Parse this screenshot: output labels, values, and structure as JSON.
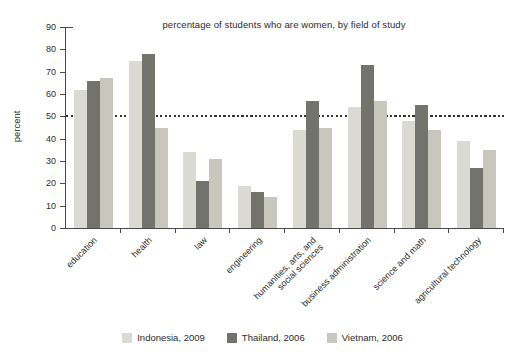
{
  "chart_data": {
    "type": "bar",
    "title": "percentage of students who are women, by field of study",
    "ylabel": "percent",
    "ylim": [
      0,
      90
    ],
    "yticks": [
      0,
      10,
      20,
      30,
      40,
      50,
      60,
      70,
      80,
      90
    ],
    "reference_line": 50,
    "grid": "off",
    "legend_position": "bottom",
    "categories": [
      "education",
      "health",
      "law",
      "engineering",
      "humanities, arts, and\nsocial sciences",
      "business administration",
      "science and math",
      "agricultural technology"
    ],
    "series": [
      {
        "name": "Indonesia, 2009",
        "color": "#dbdad2",
        "values": [
          62,
          75,
          34,
          19,
          44,
          54,
          48,
          39
        ]
      },
      {
        "name": "Thailand, 2006",
        "color": "#73736d",
        "values": [
          66,
          78,
          21,
          16,
          57,
          73,
          55,
          27
        ]
      },
      {
        "name": "Vietnam, 2006",
        "color": "#c8c7bd",
        "values": [
          67,
          45,
          31,
          14,
          45,
          57,
          44,
          35
        ]
      }
    ],
    "axis_color": "#4a4a4a",
    "text_color": "#2b2b2b",
    "reference_line_color": "#333333"
  }
}
